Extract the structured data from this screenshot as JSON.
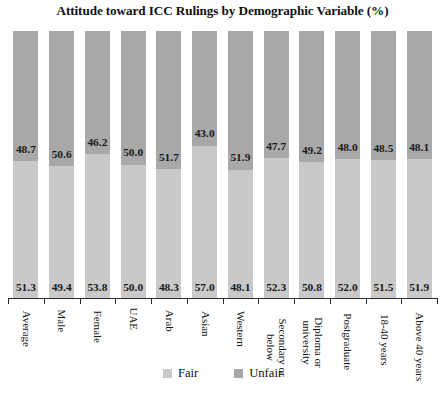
{
  "chart_data": {
    "type": "bar",
    "title": "Attitude toward ICC Rulings by Demographic Variable (%)",
    "xlabel": "",
    "ylabel": "",
    "ylim": [
      0,
      100
    ],
    "grid": false,
    "stacked": true,
    "orientation": "vertical",
    "legend_position": "bottom-center",
    "categories": [
      "Average",
      "Male",
      "Female",
      "UAE",
      "Arab",
      "Asian",
      "Western",
      "Secondary or below",
      "Diploma or university",
      "Postgraduate",
      "18-40 years",
      "Above 40 years"
    ],
    "category_lines": [
      [
        "Average"
      ],
      [
        "Male"
      ],
      [
        "Female"
      ],
      [
        "UAE"
      ],
      [
        "Arab"
      ],
      [
        "Asian"
      ],
      [
        "Western"
      ],
      [
        "Secondary or",
        "below"
      ],
      [
        "Diploma or",
        "university"
      ],
      [
        "Postgraduate"
      ],
      [
        "18-40 years"
      ],
      [
        "Above 40 years"
      ]
    ],
    "series": [
      {
        "name": "Unfair",
        "color": "#a8a8a8",
        "values": [
          48.7,
          50.6,
          46.2,
          50.0,
          51.7,
          43.0,
          51.9,
          47.7,
          49.2,
          48.0,
          48.5,
          48.1
        ]
      },
      {
        "name": "Fair",
        "color": "#c9c9c9",
        "values": [
          51.3,
          49.4,
          53.8,
          50.0,
          48.3,
          57.0,
          48.1,
          52.3,
          50.8,
          52.0,
          51.5,
          51.9
        ]
      }
    ],
    "legend": [
      {
        "label": "Fair",
        "color": "#c9c9c9"
      },
      {
        "label": "Unfair",
        "color": "#a8a8a8"
      }
    ],
    "value_label_format": "one-decimal"
  }
}
